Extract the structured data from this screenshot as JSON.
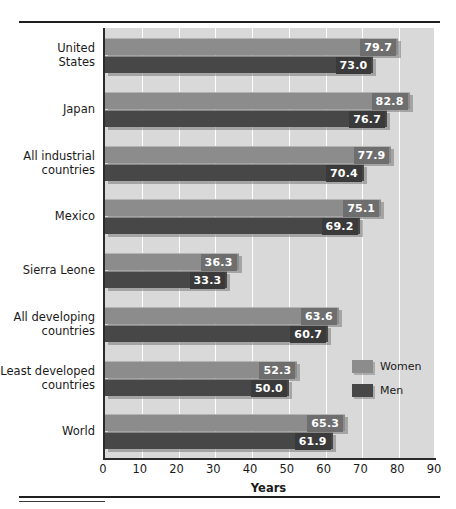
{
  "chart_data": {
    "type": "bar",
    "orientation": "horizontal",
    "title": "",
    "xlabel": "Years",
    "ylabel": "",
    "xlim": [
      0,
      90
    ],
    "xticks": [
      0,
      10,
      20,
      30,
      40,
      50,
      60,
      70,
      80,
      90
    ],
    "grid": true,
    "legend_position": "inside-right",
    "categories": [
      "United States",
      "Japan",
      "All industrial countries",
      "Mexico",
      "Sierra Leone",
      "All developing countries",
      "Least developed countries",
      "World"
    ],
    "category_lines": [
      [
        "United",
        "States"
      ],
      [
        "Japan"
      ],
      [
        "All industrial",
        "countries"
      ],
      [
        "Mexico"
      ],
      [
        "Sierra Leone"
      ],
      [
        "All developing",
        "countries"
      ],
      [
        "Least developed",
        "countries"
      ],
      [
        "World"
      ]
    ],
    "series": [
      {
        "name": "Women",
        "color": "#8c8c8c",
        "values": [
          79.7,
          82.8,
          77.9,
          75.1,
          36.3,
          63.6,
          52.3,
          65.3
        ],
        "labels": [
          "79.7",
          "82.8",
          "77.9",
          "75.1",
          "36.3",
          "63.6",
          "52.3",
          "65.3"
        ]
      },
      {
        "name": "Men",
        "color": "#474747",
        "values": [
          73.0,
          76.7,
          70.4,
          69.2,
          33.3,
          60.7,
          50.0,
          61.9
        ],
        "labels": [
          "73.0",
          "76.7",
          "70.4",
          "69.2",
          "33.3",
          "60.7",
          "50.0",
          "61.9"
        ]
      }
    ]
  },
  "legend": {
    "items": [
      {
        "label": "Women",
        "color": "#8c8c8c"
      },
      {
        "label": "Men",
        "color": "#474747"
      }
    ]
  },
  "axis": {
    "x_title": "Years",
    "tick_labels": [
      "0",
      "10",
      "20",
      "30",
      "40",
      "50",
      "60",
      "70",
      "80",
      "90"
    ]
  },
  "colors": {
    "plot_background": "#d9d9d9",
    "gridline": "#ffffff",
    "axis": "#2b2b2b",
    "women_bar": "#8c8c8c",
    "men_bar": "#474747",
    "women_value_box": "#6e6e6e",
    "men_value_box": "#3a3a3a",
    "text": "#1a1a1a",
    "page_background": "#ffffff"
  }
}
